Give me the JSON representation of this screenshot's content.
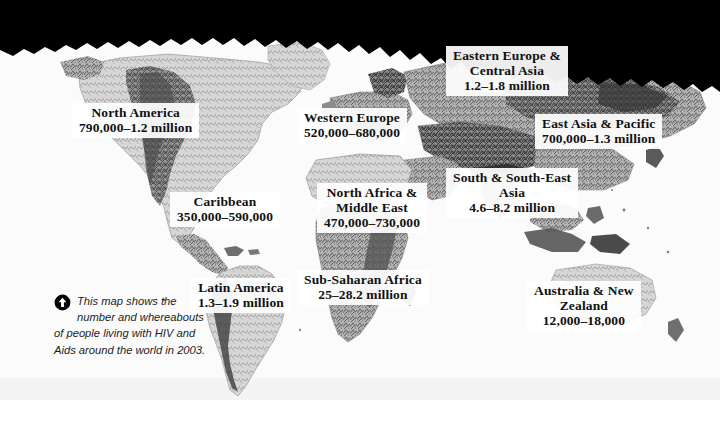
{
  "figure": {
    "type": "world-map",
    "alt": "Grayscale shaded-relief world map with boxed regional labels"
  },
  "caption": {
    "icon": "circle-up-arrow-icon",
    "text": "This map shows the number and whereabouts of people living with HIV and Aids around the world in 2003."
  },
  "regions": [
    {
      "id": "north-america",
      "name_line1": "North America",
      "name_line2": "",
      "value": "790,000–1.2 million"
    },
    {
      "id": "western-europe",
      "name_line1": "Western Europe",
      "name_line2": "",
      "value": "520,000–680,000"
    },
    {
      "id": "eastern-europe-central-asia",
      "name_line1": "Eastern Europe &",
      "name_line2": "Central Asia",
      "value": "1.2–1.8 million"
    },
    {
      "id": "east-asia-pacific",
      "name_line1": "East Asia & Pacific",
      "name_line2": "",
      "value": "700,000–1.3 million"
    },
    {
      "id": "caribbean",
      "name_line1": "Caribbean",
      "name_line2": "",
      "value": "350,000–590,000"
    },
    {
      "id": "north-africa-middle-east",
      "name_line1": "North Africa &",
      "name_line2": "Middle East",
      "value": "470,000–730,000"
    },
    {
      "id": "south-south-east-asia",
      "name_line1": "South & South-East",
      "name_line2": "Asia",
      "value": "4.6–8.2 million"
    },
    {
      "id": "latin-america",
      "name_line1": "Latin America",
      "name_line2": "",
      "value": "1.3–1.9 million"
    },
    {
      "id": "sub-saharan-africa",
      "name_line1": "Sub-Saharan Africa",
      "name_line2": "",
      "value": "25–28.2 million"
    },
    {
      "id": "australia-new-zealand",
      "name_line1": "Australia & New",
      "name_line2": "Zealand",
      "value": "12,000–18,000"
    }
  ],
  "colors": {
    "band": "#000000",
    "ocean": "#ffffff",
    "land_light": "#d8d8d8",
    "land_mid": "#a8a8a8",
    "land_dark": "#6e6e6e",
    "relief_darkest": "#2b2b2b",
    "label_background": "#ffffff",
    "text": "#111111"
  }
}
